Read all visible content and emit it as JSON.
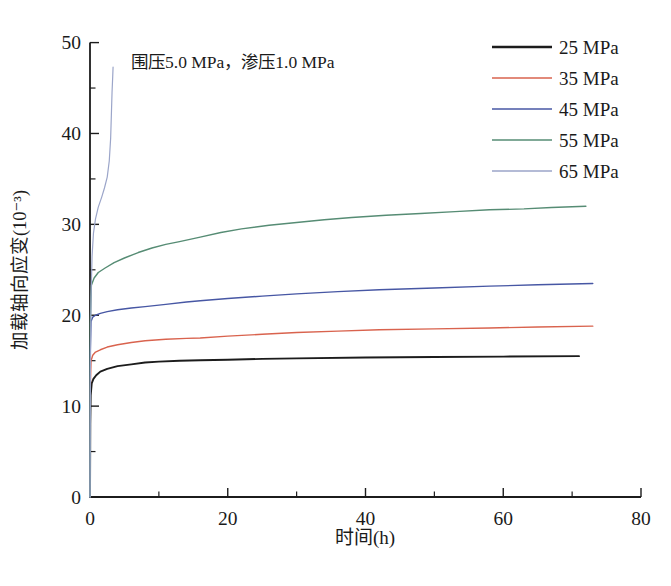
{
  "chart_data": {
    "type": "line",
    "title": "",
    "annotation": "围压5.0 MPa，渗压1.0 MPa",
    "xlabel": "时间(h)",
    "ylabel": "加载轴向应变(10⁻³)",
    "xlim": [
      0,
      80
    ],
    "ylim": [
      0,
      50
    ],
    "x_major_ticks": [
      0,
      20,
      40,
      60,
      80
    ],
    "x_minor_ticks": [
      10,
      30,
      50,
      70
    ],
    "y_major_ticks": [
      0,
      10,
      20,
      30,
      40,
      50
    ],
    "y_minor_ticks": [
      5,
      15,
      25,
      35,
      45
    ],
    "grid": false,
    "legend_position": "top-right",
    "axis_color": "#1c1c1c",
    "series": [
      {
        "name": "25 MPa",
        "color": "#1c1c1c",
        "width": 1.9,
        "points": [
          [
            0,
            0
          ],
          [
            0.04,
            8
          ],
          [
            0.1,
            11.2
          ],
          [
            0.25,
            12.5
          ],
          [
            0.5,
            13.0
          ],
          [
            0.9,
            13.4
          ],
          [
            1.5,
            13.8
          ],
          [
            2.5,
            14.1
          ],
          [
            4,
            14.4
          ],
          [
            6,
            14.6
          ],
          [
            8,
            14.8
          ],
          [
            10,
            14.9
          ],
          [
            13,
            15.0
          ],
          [
            16,
            15.05
          ],
          [
            20,
            15.1
          ],
          [
            25,
            15.2
          ],
          [
            30,
            15.25
          ],
          [
            40,
            15.35
          ],
          [
            50,
            15.4
          ],
          [
            60,
            15.45
          ],
          [
            71,
            15.5
          ]
        ]
      },
      {
        "name": "35 MPa",
        "color": "#d9634e",
        "width": 1.4,
        "points": [
          [
            0,
            0
          ],
          [
            0.04,
            12
          ],
          [
            0.15,
            15.0
          ],
          [
            0.4,
            15.6
          ],
          [
            0.8,
            15.95
          ],
          [
            1.5,
            16.2
          ],
          [
            2.5,
            16.5
          ],
          [
            4,
            16.75
          ],
          [
            6,
            17.0
          ],
          [
            8,
            17.2
          ],
          [
            11,
            17.35
          ],
          [
            14,
            17.45
          ],
          [
            16,
            17.5
          ],
          [
            20,
            17.7
          ],
          [
            25,
            17.9
          ],
          [
            30,
            18.1
          ],
          [
            36,
            18.25
          ],
          [
            42,
            18.4
          ],
          [
            50,
            18.5
          ],
          [
            58,
            18.6
          ],
          [
            65,
            18.7
          ],
          [
            73,
            18.8
          ]
        ]
      },
      {
        "name": "45 MPa",
        "color": "#4757a4",
        "width": 1.4,
        "points": [
          [
            0,
            0
          ],
          [
            0.04,
            16
          ],
          [
            0.15,
            19.3
          ],
          [
            0.4,
            19.8
          ],
          [
            0.8,
            20.0
          ],
          [
            1.5,
            20.2
          ],
          [
            2.5,
            20.4
          ],
          [
            4,
            20.6
          ],
          [
            6,
            20.8
          ],
          [
            8,
            20.95
          ],
          [
            11,
            21.2
          ],
          [
            14,
            21.45
          ],
          [
            16,
            21.6
          ],
          [
            20,
            21.85
          ],
          [
            25,
            22.1
          ],
          [
            30,
            22.35
          ],
          [
            36,
            22.6
          ],
          [
            42,
            22.8
          ],
          [
            50,
            23.0
          ],
          [
            58,
            23.2
          ],
          [
            65,
            23.35
          ],
          [
            73,
            23.5
          ]
        ]
      },
      {
        "name": "55 MPa",
        "color": "#568c74",
        "width": 1.4,
        "points": [
          [
            0,
            0
          ],
          [
            0.04,
            19
          ],
          [
            0.2,
            23.3
          ],
          [
            0.6,
            24.1
          ],
          [
            1.2,
            24.7
          ],
          [
            2.2,
            25.2
          ],
          [
            3.5,
            25.8
          ],
          [
            5,
            26.3
          ],
          [
            7,
            26.9
          ],
          [
            9,
            27.4
          ],
          [
            11,
            27.8
          ],
          [
            13,
            28.1
          ],
          [
            16,
            28.6
          ],
          [
            19,
            29.1
          ],
          [
            22,
            29.5
          ],
          [
            26,
            29.9
          ],
          [
            30,
            30.2
          ],
          [
            34,
            30.5
          ],
          [
            38,
            30.75
          ],
          [
            43,
            31.0
          ],
          [
            48,
            31.2
          ],
          [
            53,
            31.4
          ],
          [
            58,
            31.6
          ],
          [
            63,
            31.7
          ],
          [
            67,
            31.85
          ],
          [
            72,
            32.0
          ]
        ]
      },
      {
        "name": "65 MPa",
        "color": "#9ba5c9",
        "width": 1.2,
        "points": [
          [
            0,
            0
          ],
          [
            0.06,
            14
          ],
          [
            0.15,
            22
          ],
          [
            0.3,
            26.5
          ],
          [
            0.5,
            29
          ],
          [
            0.8,
            30.6
          ],
          [
            1.2,
            31.9
          ],
          [
            1.7,
            33.0
          ],
          [
            2.1,
            34.0
          ],
          [
            2.5,
            35.2
          ],
          [
            2.8,
            37.0
          ],
          [
            3.0,
            39.5
          ],
          [
            3.1,
            42.0
          ],
          [
            3.2,
            44.5
          ],
          [
            3.3,
            46.3
          ],
          [
            3.35,
            47.3
          ]
        ]
      }
    ]
  },
  "layout_note": "creep strain vs time curves, scanned journal figure style"
}
